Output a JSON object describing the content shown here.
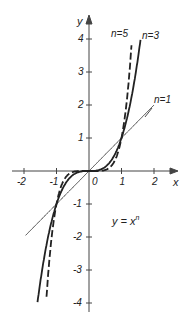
{
  "chart_data": {
    "type": "line",
    "title": "",
    "formula": "y = x",
    "formula_exponent": "n",
    "xlabel": "x",
    "ylabel": "y",
    "xlim": [
      -2.3,
      2.6
    ],
    "ylim": [
      -4.2,
      4.6
    ],
    "x_ticks": [
      -2,
      -1,
      0,
      1,
      2
    ],
    "x_tick_labels": [
      "-2",
      "-1",
      "0",
      "1",
      "2"
    ],
    "y_ticks": [
      -4,
      -3,
      -2,
      -1,
      1,
      2,
      3,
      4
    ],
    "y_tick_labels": [
      "-4",
      "-3",
      "-2",
      "-1",
      "1",
      "2",
      "3",
      "4"
    ],
    "grid": false,
    "legend": "inline labels near curves",
    "series": [
      {
        "name": "n=1",
        "label": "n=1",
        "exponent": 1,
        "style": "thin-solid",
        "x_range": [
          -1.95,
          2.0
        ]
      },
      {
        "name": "n=3",
        "label": "n=3",
        "exponent": 3,
        "style": "thick-solid",
        "x_range": [
          -1.6,
          1.6
        ]
      },
      {
        "name": "n=5",
        "label": "n=5",
        "exponent": 5,
        "style": "thick-dashed",
        "x_range": [
          -1.32,
          1.32
        ]
      }
    ],
    "key_points": [
      [
        -1,
        -1
      ],
      [
        0,
        0
      ],
      [
        1,
        1
      ]
    ]
  },
  "colors": {
    "line": "#222222",
    "axis": "#444444",
    "background": "#ffffff"
  }
}
